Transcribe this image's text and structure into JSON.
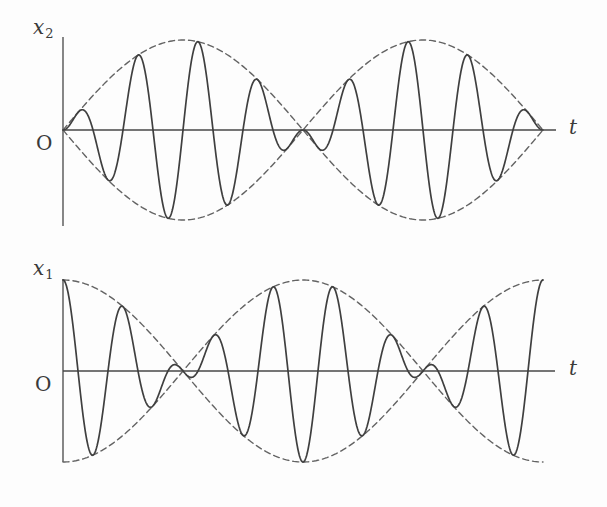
{
  "style": {
    "background": "#fdfdfd",
    "curve_color": "#3f3f3f",
    "envelope_color": "#636363",
    "axis_color": "#474747",
    "label_color": "#3a3a3a",
    "dash_pattern": [
      6,
      4
    ]
  },
  "charts": [
    {
      "id": "x2",
      "y_axis_label": {
        "base": "x",
        "sub": "2"
      },
      "origin_label": "O",
      "x_axis_label": "t"
    },
    {
      "id": "x1",
      "y_axis_label": {
        "base": "x",
        "sub": "1"
      },
      "origin_label": "O",
      "x_axis_label": "t"
    }
  ],
  "chart_data": [
    {
      "type": "line",
      "title": "Beat waveform x2 (sine envelope, zero displacement at t = 0)",
      "xlabel": "t",
      "ylabel": "x2",
      "x_range": [
        0,
        1
      ],
      "ylim": [
        -1,
        1
      ],
      "grid": false,
      "legend": false,
      "amplitude": 1,
      "carrier": {
        "shape": "sin",
        "cycles": 8
      },
      "envelope": {
        "shape": "sin",
        "cycles": 1,
        "line_style": "dashed",
        "mirrored": true
      },
      "formula": "x2(t) = sin(2*pi*t) * sin(16*pi*t)",
      "series": [
        {
          "name": "x2 oscillation",
          "definition": "sin(2*pi*t)*sin(16*pi*t)",
          "style": "solid"
        },
        {
          "name": "upper envelope",
          "definition": "+sin(2*pi*t)",
          "style": "dashed"
        },
        {
          "name": "lower envelope",
          "definition": "-sin(2*pi*t)",
          "style": "dashed"
        }
      ],
      "features": {
        "value_at_t0": 0,
        "beat_nodes_t": [
          0,
          0.5,
          1
        ],
        "envelope_maxima_t": [
          0.25,
          0.75
        ]
      }
    },
    {
      "type": "line",
      "title": "Beat waveform x1 (cosine envelope, maximum displacement at t = 0)",
      "xlabel": "t",
      "ylabel": "x1",
      "x_range": [
        0,
        1
      ],
      "ylim": [
        -1,
        1
      ],
      "grid": false,
      "legend": false,
      "amplitude": 1,
      "carrier": {
        "shape": "cos",
        "cycles": 8
      },
      "envelope": {
        "shape": "cos",
        "cycles": 1,
        "line_style": "dashed",
        "mirrored": true
      },
      "formula": "x1(t) = cos(2*pi*t) * cos(16*pi*t)",
      "series": [
        {
          "name": "x1 oscillation",
          "definition": "cos(2*pi*t)*cos(16*pi*t)",
          "style": "solid"
        },
        {
          "name": "upper envelope",
          "definition": "+cos(2*pi*t)",
          "style": "dashed"
        },
        {
          "name": "lower envelope",
          "definition": "-cos(2*pi*t)",
          "style": "dashed"
        }
      ],
      "features": {
        "value_at_t0": 1,
        "beat_nodes_t": [
          0.25,
          0.75
        ],
        "envelope_maxima_t": [
          0,
          0.5,
          1
        ]
      }
    }
  ]
}
